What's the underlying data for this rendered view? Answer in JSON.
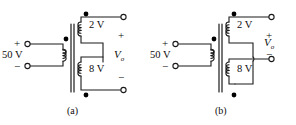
{
  "figure": {
    "panels": [
      {
        "id": "a",
        "caption": "(a)",
        "primary": {
          "source_label": "50 V",
          "plus": "+",
          "minus": "−",
          "dot_position": "top"
        },
        "secondaries": [
          {
            "label": "2 V",
            "dot_position": "top"
          },
          {
            "label": "8 V",
            "dot_position": "bottom"
          }
        ],
        "output": {
          "label": "V",
          "subscript": "o",
          "plus": "+",
          "minus": "−"
        }
      },
      {
        "id": "b",
        "caption": "(b)",
        "primary": {
          "source_label": "50 V",
          "plus": "+",
          "minus": "−",
          "dot_position": "top"
        },
        "secondaries": [
          {
            "label": "2 V",
            "dot_position": "top"
          },
          {
            "label": "8 V",
            "dot_position": "bottom"
          }
        ],
        "output": {
          "label": "V",
          "subscript": "o",
          "plus": "+",
          "minus": "−"
        }
      }
    ],
    "colors": {
      "background": "#ffffff",
      "wire": "#1a1a1a",
      "dot": "#000000",
      "terminal_fill": "#ffffff",
      "text": "#0d0d0d"
    }
  }
}
